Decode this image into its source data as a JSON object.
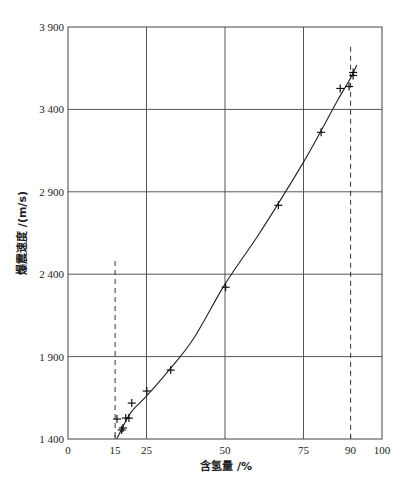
{
  "chart_data": {
    "type": "scatter",
    "title": "",
    "xlabel": "含氢量 /%",
    "ylabel": "爆震速度 /(m/s)",
    "xlim": [
      0,
      100
    ],
    "ylim": [
      1400,
      3900
    ],
    "grid": true,
    "x_ticks": [
      0,
      15,
      25,
      50,
      75,
      90,
      100
    ],
    "x_tick_labels": [
      "0",
      "15",
      "25",
      "50",
      "75",
      "90",
      "100"
    ],
    "x_gridlines": [
      25,
      50,
      75
    ],
    "y_ticks": [
      1400,
      1900,
      2400,
      2900,
      3400,
      3900
    ],
    "y_tick_labels": [
      "1 400",
      "1 900",
      "2 400",
      "2 900",
      "3 400",
      "3 900"
    ],
    "reference_lines": [
      {
        "type": "vertical-dashed",
        "x": 15,
        "y_top": 2480
      },
      {
        "type": "vertical-dashed",
        "x": 90,
        "y_top": 3780
      }
    ],
    "series": [
      {
        "name": "measured",
        "marker": "+",
        "points": [
          [
            15.6,
            1521
          ],
          [
            17.1,
            1455
          ],
          [
            17.5,
            1467
          ],
          [
            18.4,
            1527
          ],
          [
            19.4,
            1527
          ],
          [
            20.3,
            1618
          ],
          [
            25.1,
            1691
          ],
          [
            32.7,
            1818
          ],
          [
            50.2,
            2321
          ],
          [
            67.0,
            2818
          ],
          [
            80.6,
            3261
          ],
          [
            86.7,
            3527
          ],
          [
            89.5,
            3539
          ],
          [
            90.8,
            3606
          ],
          [
            90.8,
            3624
          ]
        ]
      },
      {
        "name": "fit-curve",
        "line": "solid",
        "points": [
          [
            15.5,
            1400
          ],
          [
            20,
            1560
          ],
          [
            25,
            1660
          ],
          [
            32.7,
            1830
          ],
          [
            40,
            2010
          ],
          [
            50,
            2340
          ],
          [
            60,
            2620
          ],
          [
            67,
            2830
          ],
          [
            75,
            3080
          ],
          [
            80.6,
            3270
          ],
          [
            86,
            3460
          ],
          [
            90,
            3590
          ],
          [
            92,
            3670
          ]
        ]
      }
    ]
  }
}
